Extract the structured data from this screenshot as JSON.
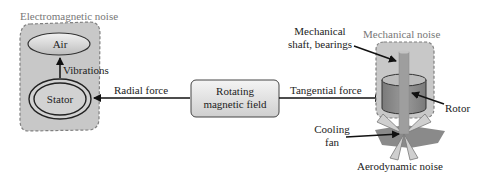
{
  "diagram": {
    "groups": {
      "electromagnetic": {
        "title": "Electromagnetic noise"
      },
      "mechanical": {
        "title": "Mechanical noise"
      },
      "aerodynamic": {
        "title": "Aerodynamic noise"
      }
    },
    "nodes": {
      "air": "Air",
      "stator": "Stator",
      "rotating_field_line1": "Rotating",
      "rotating_field_line2": "magnetic field"
    },
    "edges": {
      "vibrations": "Vibrations",
      "radial_force": "Radial force",
      "tangential_force": "Tangential force"
    },
    "callouts": {
      "shaft_line1": "Mechanical",
      "shaft_line2": "shaft, bearings",
      "rotor": "Rotor",
      "fan_line1": "Cooling",
      "fan_line2": "fan"
    },
    "colors": {
      "group_fill": "#c8c8c8",
      "group_border": "#808080",
      "node_fill": "#e4e4e4",
      "rotor_fill": "#8c8c8c",
      "shaft_fill": "#a0a0a0",
      "line": "#111111"
    }
  }
}
